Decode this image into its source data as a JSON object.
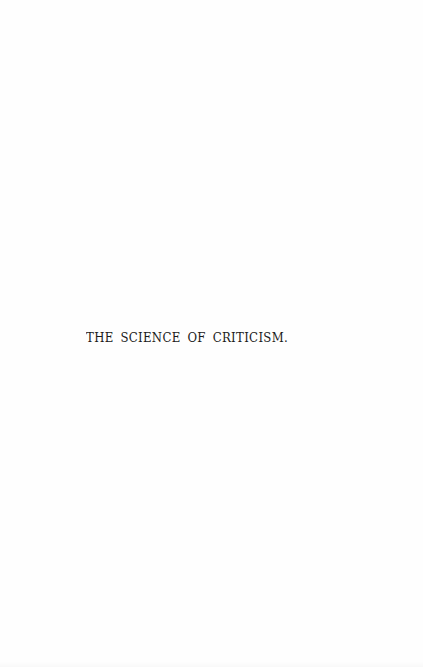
{
  "page": {
    "type": "half-title page",
    "title": "THE SCIENCE OF CRITICISM.",
    "background_color": "#fefefe",
    "text_color": "#1a1a1a"
  }
}
